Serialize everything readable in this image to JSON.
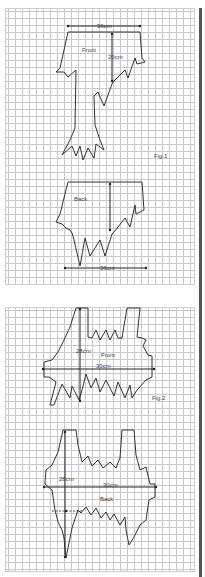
{
  "figure1": {
    "caption": "Fig.1",
    "front": {
      "label": "Front",
      "width_label": "36cm",
      "length_label": "20cm"
    },
    "back": {
      "label": "Back",
      "width_label": "36cm"
    }
  },
  "figure2": {
    "caption": "Fig.2",
    "front": {
      "label": "Front",
      "height_label": "28cm",
      "width_label": "30cm"
    },
    "back": {
      "label": "Back",
      "height_label": "28cm",
      "width_label": "30cm"
    }
  },
  "colors": {
    "grid": "#c9c9c9",
    "outline": "#333333",
    "background": "#ffffff",
    "edge_bar": "#555555"
  }
}
